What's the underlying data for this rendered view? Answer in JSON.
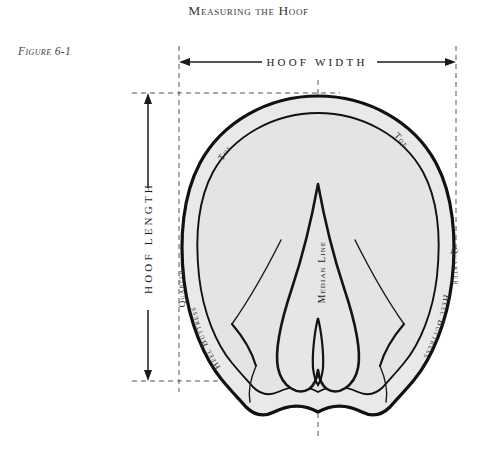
{
  "page": {
    "title": "Measuring the Hoof",
    "background_color": "#ffffff",
    "ink_color": "#231f20"
  },
  "figure": {
    "label": "Figure 6-1",
    "fill_color": "#e9e9e9",
    "outline_color": "#111113",
    "guide_color": "#55565a"
  },
  "dimensions": {
    "width_label": "HOOF WIDTH",
    "length_label": "HOOF LENGTH"
  },
  "anatomy": {
    "toe_left": "Toe",
    "toe_right": "Toe",
    "quarter_left": "Quarter",
    "quarter_right": "Quarter",
    "heel_buttress_left": "Heel Buttress",
    "heel_buttress_right": "Heel Buttress",
    "median_line": "Median Line"
  }
}
